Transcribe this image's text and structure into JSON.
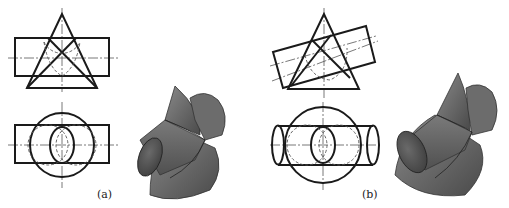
{
  "figures": [
    {
      "id": "a",
      "caption": "(a)",
      "description": "Cone and horizontal cylinder intersection, axes perpendicular",
      "views": [
        "front-view",
        "top-view",
        "shaded-3d-model"
      ]
    },
    {
      "id": "b",
      "caption": "(b)",
      "description": "Cone and inclined cylinder intersection",
      "views": [
        "front-view",
        "top-view",
        "shaded-3d-model"
      ]
    }
  ],
  "colors": {
    "line": "#1a1a1a",
    "centerline": "#555555",
    "shade_dark": "#4a4a4a",
    "shade_mid": "#6e6e6e",
    "shade_light": "#8c8c8c"
  }
}
